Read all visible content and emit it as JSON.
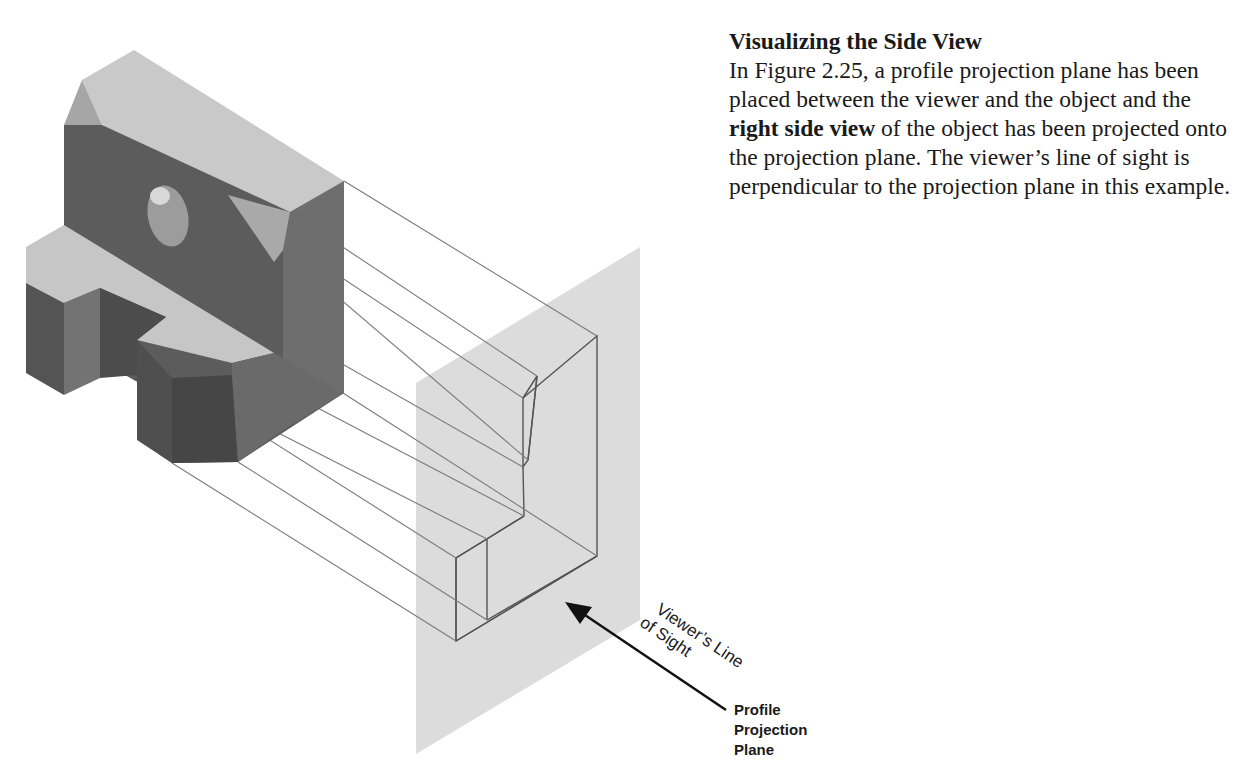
{
  "section": {
    "heading": "Visualizing the Side View",
    "paragraph": {
      "part1": "In Figure 2.25, a profile projection plane has been placed between the viewer and the object and the ",
      "bold": "right side view",
      "part2": " of the object has been projected onto the projection plane. The viewer’s line of sight is perpendicular to the projection plane in this example."
    }
  },
  "figure": {
    "figure_number": "2.25",
    "labels": {
      "line_of_sight_1": "Viewer’s Line",
      "line_of_sight_2": "of Sight",
      "plane_1": "Profile",
      "plane_2": "Projection",
      "plane_3": "Plane"
    },
    "colors": {
      "top_face": "#c8c8c8",
      "front_face": "#5a5a5a",
      "side_face": "#7a7a7a",
      "dark_face": "#4a4a4a",
      "chamfer_face": "#a8a8a8",
      "plane": "#d9d9d9",
      "projector_line": "#6e6e6e",
      "outline": "#555555",
      "arrow": "#111111"
    }
  }
}
